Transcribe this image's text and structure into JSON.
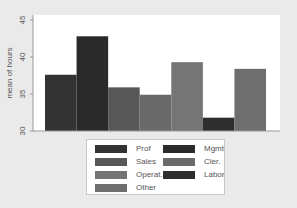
{
  "chart_data": {
    "type": "bar",
    "title": "",
    "xlabel": "",
    "ylabel": "mean of hours",
    "ylim": [
      30,
      45
    ],
    "yticks": [
      30,
      35,
      40,
      45
    ],
    "grid": false,
    "legend_position": "bottom",
    "series": [
      {
        "name": "Prof",
        "value": 37.6,
        "color": "#333333"
      },
      {
        "name": "Mgmt",
        "value": 42.8,
        "color": "#2a2a2a"
      },
      {
        "name": "Sales",
        "value": 35.9,
        "color": "#585858"
      },
      {
        "name": "Cler.",
        "value": 34.9,
        "color": "#6a6a6a"
      },
      {
        "name": "Operat.",
        "value": 39.3,
        "color": "#757575"
      },
      {
        "name": "Labor",
        "value": 31.8,
        "color": "#2e2e2e"
      },
      {
        "name": "Other",
        "value": 38.4,
        "color": "#6e6e6e"
      }
    ],
    "legend": [
      {
        "label": "Prof",
        "color": "#333333"
      },
      {
        "label": "Mgmt",
        "color": "#2a2a2a"
      },
      {
        "label": "Sales",
        "color": "#585858"
      },
      {
        "label": "Cler.",
        "color": "#6a6a6a"
      },
      {
        "label": "Operat.",
        "color": "#757575"
      },
      {
        "label": "Labor",
        "color": "#2e2e2e"
      },
      {
        "label": "Other",
        "color": "#6e6e6e"
      }
    ]
  }
}
